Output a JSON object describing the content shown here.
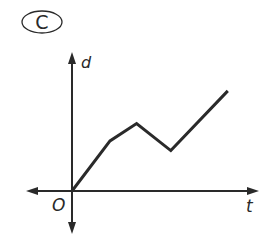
{
  "option_label": "C",
  "chart_data": {
    "type": "line",
    "title": "",
    "xlabel": "t",
    "ylabel": "d",
    "origin_label": "O",
    "x": [
      0,
      1.0,
      1.7,
      2.6,
      4.1
    ],
    "values": [
      0,
      1.3,
      1.75,
      1.05,
      2.6
    ],
    "grid": false,
    "legend": null
  },
  "colors": {
    "line": "#2a2a2a",
    "axis": "#2a2a2a",
    "background": "#ffffff"
  }
}
